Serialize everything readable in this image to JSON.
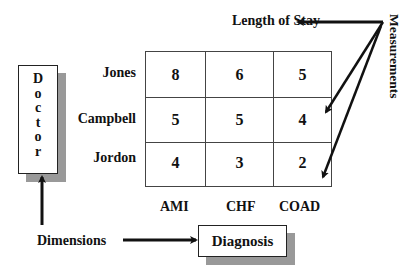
{
  "title": "Length of Stay",
  "measurements_label": "Measurements",
  "dimensions_label": "Dimensions",
  "dimension_boxes": {
    "row_dimension": "Doctor",
    "row_dimension_letters": [
      "D",
      "o",
      "c",
      "t",
      "o",
      "r"
    ],
    "column_dimension": "Diagnosis"
  },
  "table": {
    "rows": [
      "Jones",
      "Campbell",
      "Jordon"
    ],
    "columns": [
      "AMI",
      "CHF",
      "COAD"
    ],
    "values": [
      [
        "8",
        "6",
        "5"
      ],
      [
        "5",
        "5",
        "4"
      ],
      [
        "4",
        "3",
        "2"
      ]
    ]
  },
  "colors": {
    "line": "#111111",
    "shadow": "#999999",
    "grid": "#444444"
  }
}
